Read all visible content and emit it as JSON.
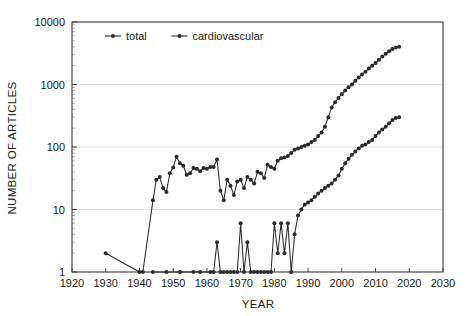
{
  "chart_data": {
    "type": "line",
    "title": "",
    "xlabel": "YEAR",
    "ylabel": "NUMBER OF ARTICLES",
    "xlim": [
      1920,
      2030
    ],
    "ylim": [
      1,
      10000
    ],
    "yscale": "log",
    "grid": true,
    "legend_position": "top-center-inside",
    "xticks": [
      1920,
      1930,
      1940,
      1950,
      1960,
      1970,
      1980,
      1990,
      2000,
      2010,
      2020,
      2030
    ],
    "xtick_labels": [
      "1920",
      "1930",
      "1940",
      "1950",
      "1960",
      "1970",
      "1980",
      "1990",
      "2000",
      "2010",
      "2020",
      "2030"
    ],
    "yticks": [
      1,
      10,
      100,
      1000,
      10000
    ],
    "ytick_labels": [
      "1",
      "10",
      "100",
      "1000",
      "10000"
    ],
    "series": [
      {
        "name": "total",
        "marker": "circle",
        "color": "#2b2b2b",
        "x": [
          1930,
          1940,
          1941,
          1944,
          1945,
          1946,
          1947,
          1948,
          1949,
          1950,
          1951,
          1952,
          1953,
          1954,
          1955,
          1956,
          1957,
          1958,
          1959,
          1960,
          1961,
          1962,
          1963,
          1964,
          1965,
          1966,
          1967,
          1968,
          1969,
          1970,
          1971,
          1972,
          1973,
          1974,
          1975,
          1976,
          1977,
          1978,
          1979,
          1980,
          1981,
          1982,
          1983,
          1984,
          1985,
          1986,
          1987,
          1988,
          1989,
          1990,
          1991,
          1992,
          1993,
          1994,
          1995,
          1996,
          1997,
          1998,
          1999,
          2000,
          2001,
          2002,
          2003,
          2004,
          2005,
          2006,
          2007,
          2008,
          2009,
          2010,
          2011,
          2012,
          2013,
          2014,
          2015,
          2016,
          2017
        ],
        "y": [
          2,
          1,
          1,
          14,
          30,
          33,
          22,
          19,
          38,
          47,
          70,
          55,
          50,
          36,
          38,
          46,
          45,
          41,
          46,
          45,
          48,
          48,
          63,
          20,
          14,
          30,
          24,
          17,
          28,
          30,
          22,
          33,
          30,
          26,
          40,
          38,
          32,
          52,
          48,
          45,
          60,
          66,
          68,
          72,
          80,
          90,
          95,
          100,
          105,
          110,
          120,
          130,
          150,
          170,
          210,
          300,
          430,
          520,
          610,
          700,
          800,
          900,
          1000,
          1150,
          1300,
          1450,
          1600,
          1800,
          2000,
          2200,
          2500,
          2800,
          3100,
          3400,
          3700,
          3900,
          4000
        ]
      },
      {
        "name": "cardiovascular",
        "marker": "circle",
        "color": "#2b2b2b",
        "x": [
          1944,
          1948,
          1952,
          1956,
          1958,
          1961,
          1962,
          1963,
          1964,
          1965,
          1966,
          1967,
          1968,
          1969,
          1970,
          1971,
          1972,
          1973,
          1974,
          1975,
          1976,
          1977,
          1978,
          1979,
          1980,
          1981,
          1982,
          1983,
          1984,
          1985,
          1986,
          1987,
          1988,
          1989,
          1990,
          1991,
          1992,
          1993,
          1994,
          1995,
          1996,
          1997,
          1998,
          1999,
          2000,
          2001,
          2002,
          2003,
          2004,
          2005,
          2006,
          2007,
          2008,
          2009,
          2010,
          2011,
          2012,
          2013,
          2014,
          2015,
          2016,
          2017
        ],
        "y": [
          1,
          1,
          1,
          1,
          1,
          1,
          1,
          3,
          1,
          1,
          1,
          1,
          1,
          1,
          6,
          1,
          3,
          1,
          1,
          1,
          1,
          1,
          1,
          1,
          6,
          2,
          6,
          2,
          6,
          1,
          4,
          8,
          10,
          12,
          13,
          14,
          16,
          18,
          20,
          22,
          24,
          26,
          30,
          35,
          45,
          55,
          65,
          75,
          85,
          95,
          105,
          110,
          120,
          130,
          150,
          170,
          190,
          210,
          240,
          270,
          290,
          300
        ]
      }
    ]
  },
  "legend": {
    "items": [
      {
        "label": "total"
      },
      {
        "label": "cardiovascular"
      }
    ]
  }
}
